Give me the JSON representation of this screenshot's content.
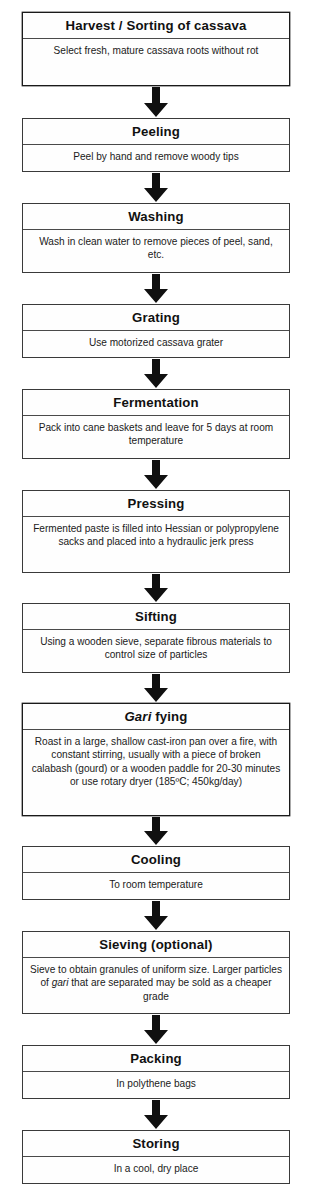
{
  "diagram": {
    "connector_icon": "down-arrow-icon",
    "line_color": "#3a3a3a",
    "text_color": "#111111",
    "background": "#ffffff",
    "steps": [
      {
        "id": "harvest",
        "header": "Harvest / Sorting of cassava",
        "body": "Select fresh, mature cassava roots without rot"
      },
      {
        "id": "peeling",
        "header": "Peeling",
        "body": "Peel by hand and remove woody tips"
      },
      {
        "id": "washing",
        "header": "Washing",
        "body": "Wash in clean water to remove pieces of peel, sand, etc."
      },
      {
        "id": "grating",
        "header": "Grating",
        "body": "Use motorized cassava grater"
      },
      {
        "id": "fermentation",
        "header": "Fermentation",
        "body": "Pack into cane baskets and leave for 5 days at room temperature"
      },
      {
        "id": "pressing",
        "header": "Pressing",
        "body": "Fermented paste is filled into Hessian or polypropylene sacks and placed into a hydraulic jerk press"
      },
      {
        "id": "sifting",
        "header": "Sifting",
        "body": "Using a wooden sieve, separate fibrous materials to control size of particles"
      },
      {
        "id": "gari-fying",
        "header_italic": "Gari",
        "header_rest": " fying",
        "body": "Roast in a large, shallow cast-iron pan over a fire, with constant stirring, usually with a piece of broken calabash (gourd) or a wooden paddle for 20-30 minutes or use rotary dryer (185ºC; 450kg/day)"
      },
      {
        "id": "cooling",
        "header": "Cooling",
        "body": "To room temperature"
      },
      {
        "id": "sieving",
        "header": "Sieving (optional)",
        "body_part1": "Sieve to obtain granules of uniform size. Larger particles of ",
        "body_italic": "gari",
        "body_part2": " that are separated may be sold as a cheaper grade"
      },
      {
        "id": "packing",
        "header": "Packing",
        "body": "In polythene bags"
      },
      {
        "id": "storing",
        "header": "Storing",
        "body": "In a cool, dry place"
      }
    ]
  }
}
